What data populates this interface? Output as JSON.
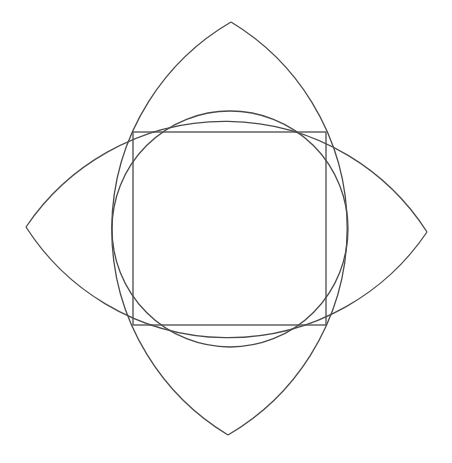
{
  "diagram": {
    "colors": {
      "stroke": "#4a4a4a",
      "background": "#ffffff"
    },
    "square": {
      "x1": 133,
      "y1": 132,
      "x2": 326,
      "y2": 325
    },
    "circle": {
      "cx": 230,
      "cy": 229,
      "r": 118
    },
    "vertical_lens": {
      "top_apex": [
        231,
        22
      ],
      "bottom_apex": [
        228,
        435
      ],
      "arc_radius": 240
    },
    "horizontal_lens": {
      "left_apex": [
        26,
        227
      ],
      "right_apex": [
        427,
        232
      ],
      "arc_radius": 240
    }
  }
}
